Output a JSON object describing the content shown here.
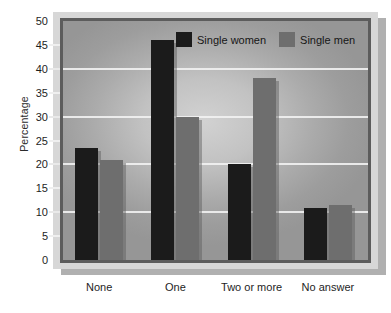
{
  "chart_data": {
    "type": "bar",
    "title": "",
    "subtitle": "",
    "xlabel": "",
    "ylabel": "Percentage",
    "categories": [
      "None",
      "One",
      "Two or more",
      "No answer"
    ],
    "series": [
      {
        "name": "Single women",
        "color": "#1b1b1b",
        "values": [
          23.5,
          46,
          20,
          10.8
        ]
      },
      {
        "name": "Single men",
        "color": "#6e6e6e",
        "values": [
          21,
          30,
          38,
          11.5
        ]
      }
    ],
    "ylim": [
      0,
      50
    ],
    "ytick_labels": [
      "0",
      "5",
      "10",
      "15",
      "20",
      "25",
      "30",
      "35",
      "40",
      "45",
      "50"
    ],
    "ytick_values": [
      0,
      5,
      10,
      15,
      20,
      25,
      30,
      35,
      40,
      45,
      50
    ],
    "gridlines": [
      10,
      20,
      30,
      40
    ],
    "grid": true,
    "legend_position": "top-center",
    "legend_entries": [
      "Single women",
      "Single men"
    ]
  },
  "colors": {
    "series_women": "#1b1b1b",
    "series_men": "#6e6e6e",
    "gridline": "#f2f2f2",
    "plot_border": "#5c5c5c",
    "panel_frame": "#d7d7d7",
    "panel_shadow": "#b0b0b0",
    "text": "#1e1e1e"
  }
}
